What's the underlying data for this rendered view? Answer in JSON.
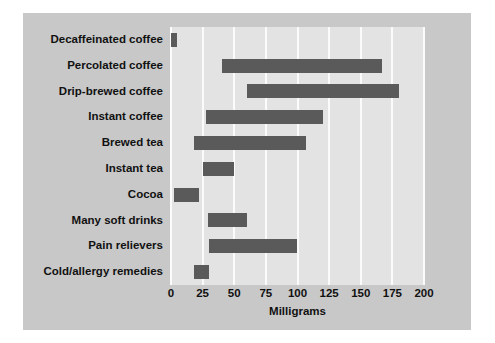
{
  "chart_data": {
    "type": "bar",
    "orientation": "horizontal",
    "subtype": "range-bar",
    "title": "",
    "xlabel": "Milligrams",
    "ylabel": "",
    "xlim": [
      0,
      200
    ],
    "xticks": [
      0,
      25,
      50,
      75,
      100,
      125,
      150,
      175,
      200
    ],
    "grid": "vertical",
    "legend": "none",
    "categories": [
      "Decaffeinated coffee",
      "Percolated coffee",
      "Drip-brewed coffee",
      "Instant coffee",
      "Brewed tea",
      "Instant tea",
      "Cocoa",
      "Many soft drinks",
      "Pain relievers",
      "Cold/allergy remedies"
    ],
    "ranges": [
      {
        "label": "Decaffeinated coffee",
        "start": 0,
        "end": 5
      },
      {
        "label": "Percolated coffee",
        "start": 40,
        "end": 167
      },
      {
        "label": "Drip-brewed coffee",
        "start": 60,
        "end": 180
      },
      {
        "label": "Instant coffee",
        "start": 28,
        "end": 120
      },
      {
        "label": "Brewed tea",
        "start": 18,
        "end": 107
      },
      {
        "label": "Instant tea",
        "start": 25,
        "end": 50
      },
      {
        "label": "Cocoa",
        "start": 2,
        "end": 22
      },
      {
        "label": "Many soft drinks",
        "start": 29,
        "end": 60
      },
      {
        "label": "Pain relievers",
        "start": 30,
        "end": 100
      },
      {
        "label": "Cold/allergy remedies",
        "start": 18,
        "end": 30
      }
    ],
    "colors": {
      "bar": "#5a5a5a",
      "plot_background": "#e3e3e3",
      "figure_background": "#c8c8c8",
      "gridline": "#fbfbfb",
      "text": "#111111"
    }
  }
}
